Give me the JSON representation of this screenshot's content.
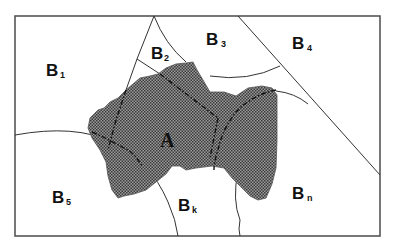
{
  "diagram": {
    "central_region": {
      "label": "A"
    },
    "regions": [
      {
        "id": "B1",
        "letter": "B",
        "subscript": "1"
      },
      {
        "id": "B2",
        "letter": "B",
        "subscript": "2"
      },
      {
        "id": "B3",
        "letter": "B",
        "subscript": "3"
      },
      {
        "id": "B4",
        "letter": "B",
        "subscript": "4"
      },
      {
        "id": "B5",
        "letter": "B",
        "subscript": "5"
      },
      {
        "id": "Bk",
        "letter": "B",
        "subscript": "k"
      },
      {
        "id": "Bn",
        "letter": "B",
        "subscript": "n"
      }
    ],
    "colors": {
      "frame": "#555555",
      "boundary": "#333333",
      "hatch_dark": "#3a3a3a",
      "hatch_light": "#9a9a9a",
      "text": "#111111"
    }
  }
}
